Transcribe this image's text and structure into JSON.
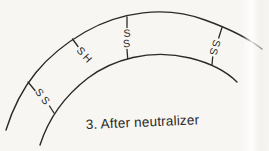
{
  "figure": {
    "caption": "3. After neutralizer",
    "colors": {
      "ink": "#2b2a28",
      "paper": "#f7f6f3"
    },
    "bonds": [
      {
        "name": "left-disulfide-bond",
        "letters": [
          "S",
          "S"
        ]
      },
      {
        "name": "upper-left-broken-bond",
        "letters": [
          "S",
          "H"
        ]
      },
      {
        "name": "middle-disulfide-bond",
        "letters": [
          "S",
          "S"
        ]
      },
      {
        "name": "right-disulfide-bond",
        "letters": [
          "S",
          "S"
        ]
      }
    ]
  }
}
